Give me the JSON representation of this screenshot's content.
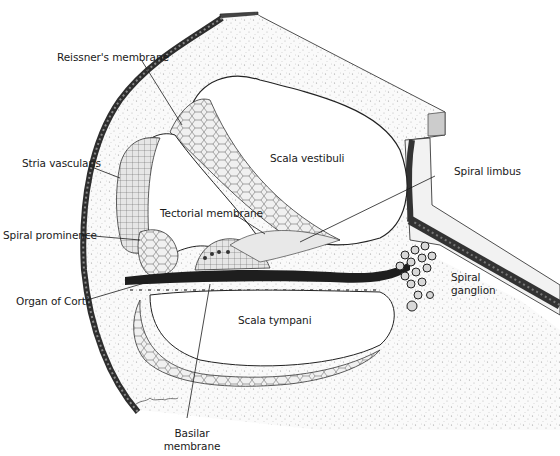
{
  "figure": {
    "signature": "artist signature",
    "colors": {
      "ink": "#1a1a1a",
      "bone_stipple": "#f4f4f4",
      "dark_wall": "#3a3a3a",
      "background": "#ffffff"
    }
  },
  "labels": {
    "reissners_membrane": "Reissner's membrane",
    "stria_vascularis": "Stria vascularis",
    "scala_vestibuli": "Scala vestibuli",
    "spiral_limbus": "Spiral limbus",
    "tectorial_membrane": "Tectorial membrane",
    "spiral_prominence": "Spiral prominence",
    "spiral_ganglion_line1": "Spiral",
    "spiral_ganglion_line2": "ganglion",
    "organ_of_corti": "Organ of Corti",
    "scala_tympani": "Scala tympani",
    "basilar_membrane_line1": "Basilar",
    "basilar_membrane_line2": "membrane"
  }
}
